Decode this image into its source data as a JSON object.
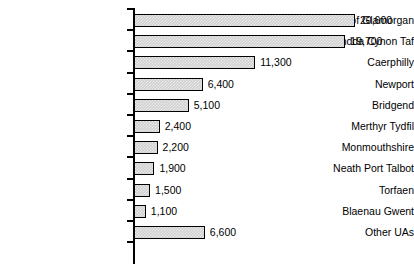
{
  "chart_data": {
    "type": "bar",
    "orientation": "horizontal",
    "title": "",
    "subtitle": "",
    "xlabel": "",
    "ylabel": "",
    "grid": false,
    "legend": false,
    "axis_ticks_visible": false,
    "xlim": [
      0,
      20600
    ],
    "categories": [
      "Vale of Glamorgan",
      "Rhondda Cynon Taf",
      "Caerphilly",
      "Newport",
      "Bridgend",
      "Merthyr Tydfil",
      "Monmouthshire",
      "Neath Port Talbot",
      "Torfaen",
      "Blaenau Gwent",
      "Other UAs"
    ],
    "values": [
      20600,
      19700,
      11300,
      6400,
      5100,
      2400,
      2200,
      1900,
      1500,
      1100,
      6600
    ],
    "value_labels": [
      "20,600",
      "19,700",
      "11,300",
      "6,400",
      "5,100",
      "2,400",
      "2,200",
      "1,900",
      "1,500",
      "1,100",
      "6,600"
    ],
    "colors": {
      "bar_fill": "#cfcfcf",
      "bar_edge": "#000000",
      "axis": "#000000",
      "text": "#000000",
      "background": "#ffffff"
    }
  }
}
